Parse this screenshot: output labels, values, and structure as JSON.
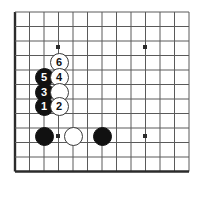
{
  "diagram": {
    "kind": "go-board-diagram",
    "board_size": 19,
    "view": "bottom-left corner",
    "background_color": "#ffffff",
    "line_color": "#5a5a5a",
    "edge_color": "#2b2b2b",
    "black_color": "#111111",
    "white_color": "#ffffff",
    "geometry": {
      "origin_x": 15,
      "origin_y": 12,
      "spacing": 14.5,
      "cols": 13,
      "rows": 12,
      "stone_diameter": 19
    },
    "star_points": [
      {
        "name": "star-point-upper-left",
        "x": 58,
        "y": 47
      },
      {
        "name": "star-point-upper-right",
        "x": 145,
        "y": 47
      },
      {
        "name": "star-point-lower-left",
        "x": 58,
        "y": 136
      },
      {
        "name": "star-point-lower-right",
        "x": 145,
        "y": 136
      }
    ],
    "stones": [
      {
        "name": "white-stone-6",
        "color": "white",
        "label": "6",
        "x": 59,
        "y": 62
      },
      {
        "name": "black-stone-5",
        "color": "black",
        "label": "5",
        "x": 44,
        "y": 77
      },
      {
        "name": "white-stone-4",
        "color": "white",
        "label": "4",
        "x": 59,
        "y": 77
      },
      {
        "name": "black-stone-3",
        "color": "black",
        "label": "3",
        "x": 44,
        "y": 92
      },
      {
        "name": "white-stone-unnumbered-upper",
        "color": "white",
        "label": "",
        "x": 59,
        "y": 92
      },
      {
        "name": "black-stone-1",
        "color": "black",
        "label": "1",
        "x": 44,
        "y": 106
      },
      {
        "name": "white-stone-2",
        "color": "white",
        "label": "2",
        "x": 59,
        "y": 106
      },
      {
        "name": "black-stone-corner-left",
        "color": "black",
        "label": "",
        "x": 44,
        "y": 136
      },
      {
        "name": "white-stone-lower-middle",
        "color": "white",
        "label": "",
        "x": 73,
        "y": 136
      },
      {
        "name": "black-stone-lower-right",
        "color": "black",
        "label": "",
        "x": 102,
        "y": 136
      }
    ]
  }
}
